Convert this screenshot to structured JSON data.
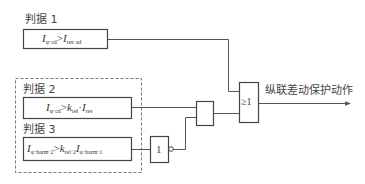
{
  "criteria": [
    {
      "label": "判据 1",
      "formula": {
        "lhs_var": "I",
        "lhs_sub": "φ·cd",
        "op": ">",
        "rhs_coef_var": "",
        "rhs_coef_sub": "",
        "rhs_var": "I",
        "rhs_sub": "res·ad",
        "dot": ""
      }
    },
    {
      "label": "判据 2",
      "formula": {
        "lhs_var": "I",
        "lhs_sub": "φ·cd",
        "op": ">",
        "rhs_coef_var": "k",
        "rhs_coef_sub": "rel",
        "dot": "·",
        "rhs_var": "I",
        "rhs_sub": "res"
      }
    },
    {
      "label": "判据 3",
      "formula": {
        "lhs_var": "I",
        "lhs_sub": "φ·harm·2",
        "op": ">",
        "rhs_coef_var": "k",
        "rhs_coef_sub": "rel·2",
        "dot": "",
        "rhs_var": "I",
        "rhs_sub": "φ·harm·1"
      }
    }
  ],
  "gates": {
    "not_gate": {
      "label": "1",
      "type": "NOT"
    },
    "and_gate": {
      "label": "",
      "type": "AND"
    },
    "or_gate": {
      "label": "≥1",
      "type": "OR"
    }
  },
  "output": {
    "label": "纵联差动保护动作"
  },
  "colors": {
    "line": "#555555",
    "dashed": "#777777",
    "background": "#ffffff"
  }
}
